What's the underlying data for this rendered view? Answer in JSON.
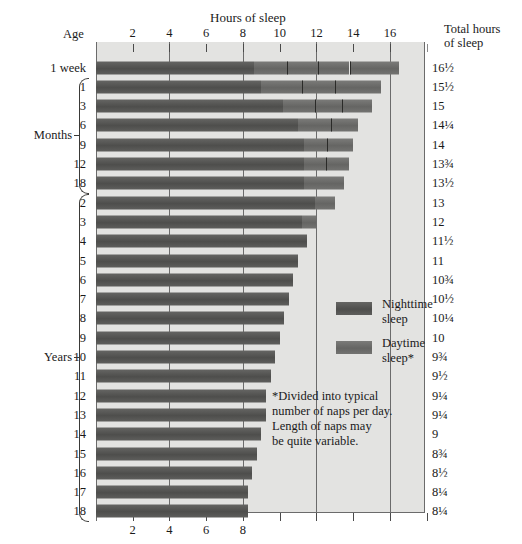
{
  "chart_data": {
    "type": "bar",
    "title": "Hours of sleep",
    "xlabel": "Hours of sleep",
    "ylabel": "Age",
    "xlim": [
      0,
      17.8
    ],
    "grid": true,
    "grid_values": [
      4,
      8,
      12,
      16
    ],
    "x_ticks_top": [
      2,
      4,
      6,
      8,
      10,
      12,
      14,
      16
    ],
    "x_ticks_bottom": [
      2,
      4,
      6,
      8
    ],
    "legend_position": "inside-right",
    "series": [
      {
        "name": "Nighttime sleep",
        "color": "#565654"
      },
      {
        "name": "Daytime sleep*",
        "color": "#6e6e6c"
      }
    ],
    "categories": [
      "1 week",
      "1",
      "3",
      "6",
      "9",
      "12",
      "18",
      "2",
      "3",
      "4",
      "5",
      "6",
      "7",
      "8",
      "9",
      "10",
      "11",
      "12",
      "13",
      "14",
      "15",
      "16",
      "17",
      "18"
    ],
    "rows": [
      {
        "label": "1 week",
        "group": "",
        "total": "16½",
        "total_value": 16.5,
        "night_start": 0.0,
        "night_end": 8.6,
        "naps": [
          [
            8.6,
            10.4
          ],
          [
            10.4,
            12.1
          ],
          [
            12.1,
            13.8
          ],
          [
            13.8,
            16.5
          ]
        ]
      },
      {
        "label": "1",
        "group": "months",
        "total": "15½",
        "total_value": 15.5,
        "night_start": 0.0,
        "night_end": 9.0,
        "naps": [
          [
            9.0,
            11.2
          ],
          [
            11.2,
            13.0
          ],
          [
            13.0,
            15.5
          ]
        ]
      },
      {
        "label": "3",
        "group": "months",
        "total": "15",
        "total_value": 15.0,
        "night_start": 0.0,
        "night_end": 10.2,
        "naps": [
          [
            10.2,
            11.9
          ],
          [
            11.9,
            13.4
          ],
          [
            13.4,
            15.0
          ]
        ]
      },
      {
        "label": "6",
        "group": "months",
        "total": "14¼",
        "total_value": 14.25,
        "night_start": 0.0,
        "night_end": 11.0,
        "naps": [
          [
            11.0,
            12.8
          ],
          [
            12.8,
            14.25
          ]
        ]
      },
      {
        "label": "9",
        "group": "months",
        "total": "14",
        "total_value": 14.0,
        "night_start": 0.0,
        "night_end": 11.3,
        "naps": [
          [
            11.3,
            12.6
          ],
          [
            12.6,
            14.0
          ]
        ]
      },
      {
        "label": "12",
        "group": "months",
        "total": "13¾",
        "total_value": 13.75,
        "night_start": 0.0,
        "night_end": 11.3,
        "naps": [
          [
            11.3,
            12.5
          ],
          [
            12.5,
            13.75
          ]
        ]
      },
      {
        "label": "18",
        "group": "months",
        "total": "13½",
        "total_value": 13.5,
        "night_start": 0.0,
        "night_end": 11.3,
        "naps": [
          [
            11.3,
            13.5
          ]
        ]
      },
      {
        "label": "2",
        "group": "years",
        "total": "13",
        "total_value": 13.0,
        "night_start": 0.0,
        "night_end": 11.9,
        "naps": [
          [
            11.9,
            13.0
          ]
        ]
      },
      {
        "label": "3",
        "group": "years",
        "total": "12",
        "total_value": 12.0,
        "night_start": 0.0,
        "night_end": 11.2,
        "naps": [
          [
            11.2,
            12.0
          ]
        ]
      },
      {
        "label": "4",
        "group": "years",
        "total": "11½",
        "total_value": 11.5,
        "night_start": 0.0,
        "night_end": 11.5,
        "naps": []
      },
      {
        "label": "5",
        "group": "years",
        "total": "11",
        "total_value": 11.0,
        "night_start": 0.0,
        "night_end": 11.0,
        "naps": []
      },
      {
        "label": "6",
        "group": "years",
        "total": "10¾",
        "total_value": 10.75,
        "night_start": 0.0,
        "night_end": 10.75,
        "naps": []
      },
      {
        "label": "7",
        "group": "years",
        "total": "10½",
        "total_value": 10.5,
        "night_start": 0.0,
        "night_end": 10.5,
        "naps": []
      },
      {
        "label": "8",
        "group": "years",
        "total": "10¼",
        "total_value": 10.25,
        "night_start": 0.0,
        "night_end": 10.25,
        "naps": []
      },
      {
        "label": "9",
        "group": "years",
        "total": "10",
        "total_value": 10.0,
        "night_start": 0.0,
        "night_end": 10.0,
        "naps": []
      },
      {
        "label": "10",
        "group": "years",
        "total": "9¾",
        "total_value": 9.75,
        "night_start": 0.0,
        "night_end": 9.75,
        "naps": []
      },
      {
        "label": "11",
        "group": "years",
        "total": "9½",
        "total_value": 9.5,
        "night_start": 0.0,
        "night_end": 9.5,
        "naps": []
      },
      {
        "label": "12",
        "group": "years",
        "total": "9¼",
        "total_value": 9.25,
        "night_start": 0.0,
        "night_end": 9.25,
        "naps": []
      },
      {
        "label": "13",
        "group": "years",
        "total": "9¼",
        "total_value": 9.25,
        "night_start": 0.0,
        "night_end": 9.25,
        "naps": []
      },
      {
        "label": "14",
        "group": "years",
        "total": "9",
        "total_value": 9.0,
        "night_start": 0.0,
        "night_end": 9.0,
        "naps": []
      },
      {
        "label": "15",
        "group": "years",
        "total": "8¾",
        "total_value": 8.75,
        "night_start": 0.0,
        "night_end": 8.75,
        "naps": []
      },
      {
        "label": "16",
        "group": "years",
        "total": "8½",
        "total_value": 8.5,
        "night_start": 0.0,
        "night_end": 8.5,
        "naps": []
      },
      {
        "label": "17",
        "group": "years",
        "total": "8¼",
        "total_value": 8.25,
        "night_start": 0.0,
        "night_end": 8.25,
        "naps": []
      },
      {
        "label": "18",
        "group": "years",
        "total": "8¼",
        "total_value": 8.25,
        "night_start": 0.0,
        "night_end": 8.25,
        "naps": []
      }
    ]
  },
  "headers": {
    "top_title": "Hours of sleep",
    "age_label": "Age",
    "total_label_line1": "Total hours",
    "total_label_line2": "of sleep"
  },
  "groups": {
    "months_label": "Months",
    "years_label": "Years"
  },
  "legend": {
    "night_line1": "Nighttime",
    "night_line2": "sleep",
    "day_line1": "Daytime",
    "day_line2": "sleep*"
  },
  "footnote": {
    "line1": "*Divided into typical",
    "line2": "number of naps per day.",
    "line3": "Length of naps may",
    "line4": "be quite variable."
  },
  "colors": {
    "night": "#565654",
    "day": "#6e6e6c",
    "panel": "#e3e3e1",
    "grid": "#6b6b6b"
  }
}
